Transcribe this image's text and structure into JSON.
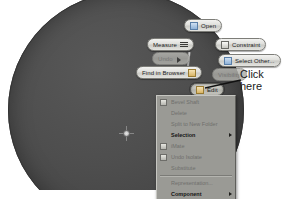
{
  "viewport": {
    "model_name": "shaft-disk-part",
    "body_color": "#4a4a4a",
    "background_color": "#ffffff",
    "center_point_label": "center-point"
  },
  "marking_menu": {
    "items": [
      {
        "id": "open",
        "label": "Open",
        "icon": "document-icon",
        "state": "enabled"
      },
      {
        "id": "measure",
        "label": "Measure",
        "icon": "ruler-icon",
        "state": "enabled"
      },
      {
        "id": "undo",
        "label": "Undo",
        "icon": "undo-icon",
        "state": "disabled"
      },
      {
        "id": "find-browser",
        "label": "Find in Browser",
        "icon": "browser-icon",
        "state": "enabled"
      },
      {
        "id": "constraint",
        "label": "Constraint",
        "icon": "constraint-icon",
        "state": "enabled"
      },
      {
        "id": "select-other",
        "label": "Select Other...",
        "icon": "select-other-icon",
        "state": "enabled"
      },
      {
        "id": "visibility",
        "label": "Visibility",
        "icon": "eye-icon",
        "state": "disabled"
      },
      {
        "id": "edit",
        "label": "Edit",
        "icon": "edit-icon",
        "state": "active"
      }
    ]
  },
  "context_menu": {
    "items": [
      {
        "id": "bevel-shaft",
        "label": "Bevel Shaft",
        "icon": "part-icon",
        "style": "dim",
        "submenu": false
      },
      {
        "id": "delete",
        "label": "Delete",
        "icon": "none",
        "style": "dim",
        "submenu": false
      },
      {
        "id": "split-folder",
        "label": "Split to New Folder",
        "icon": "none",
        "style": "dim",
        "submenu": false
      },
      {
        "id": "selection",
        "label": "Selection",
        "icon": "none",
        "style": "bold",
        "submenu": true
      },
      {
        "id": "iterate",
        "label": "iMate",
        "icon": "imate-icon",
        "style": "dim",
        "submenu": false
      },
      {
        "id": "undo-isolate",
        "label": "Undo Isolate",
        "icon": "undo-isolate-icon",
        "style": "dim",
        "submenu": false
      },
      {
        "id": "substitute",
        "label": "Substitute",
        "icon": "none",
        "style": "dim",
        "submenu": false
      },
      {
        "id": "separator-1",
        "label": "",
        "icon": "none",
        "style": "sep",
        "submenu": false
      },
      {
        "id": "representation",
        "label": "Representation...",
        "icon": "none",
        "style": "dim",
        "submenu": false
      },
      {
        "id": "component",
        "label": "Component",
        "icon": "none",
        "style": "bold",
        "submenu": true
      }
    ]
  },
  "annotation": {
    "line1": "Click",
    "line2": "here",
    "target": "edit"
  }
}
